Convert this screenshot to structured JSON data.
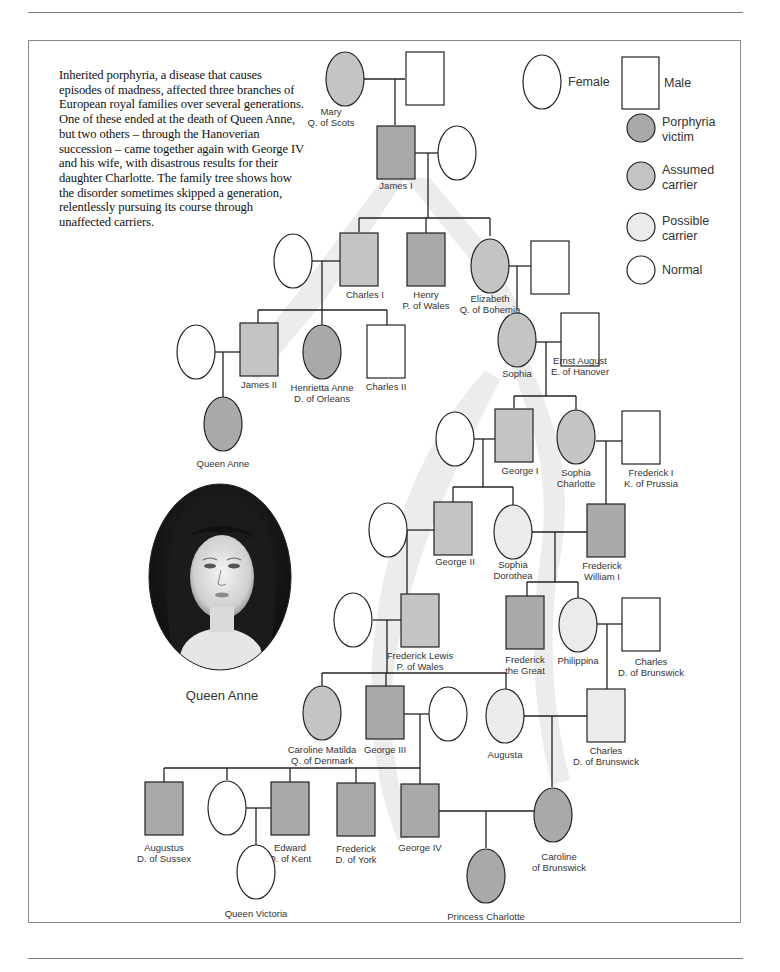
{
  "intro_text": "Inherited porphyria, a disease that causes episodes of madness, affected three branches of European royal families over several generations. One of these ended at the death of Queen Anne, but two others – through the Hanoverian succession – came together again with George IV and his wife, with disastrous results for their daughter Charlotte. The family tree shows how the disorder sometimes skipped a generation, relentlessly pursuing its course through unaffected carriers.",
  "colors": {
    "victim": "#a9a9a9",
    "assumed_carrier": "#c4c4c4",
    "possible_carrier": "#ebebeb",
    "normal": "#ffffff",
    "path_band": "#ececec",
    "line": "#222222"
  },
  "legend": {
    "female": "Female",
    "male": "Male",
    "items": [
      {
        "status": "victim",
        "label_1": "Porphyria",
        "label_2": "victim"
      },
      {
        "status": "assumed_carrier",
        "label_1": "Assumed",
        "label_2": "carrier"
      },
      {
        "status": "possible_carrier",
        "label_1": "Possible",
        "label_2": "carrier"
      },
      {
        "status": "normal",
        "label_1": "Normal",
        "label_2": ""
      }
    ]
  },
  "portrait": {
    "caption": "Queen Anne"
  },
  "people": [
    {
      "id": "mary",
      "line1": "Mary",
      "line2": "Q. of Scots",
      "sex": "F",
      "status": "assumed_carrier"
    },
    {
      "id": "mary_spouse",
      "line1": "",
      "line2": "",
      "sex": "M",
      "status": "normal"
    },
    {
      "id": "james1",
      "line1": "James I",
      "line2": "",
      "sex": "M",
      "status": "victim"
    },
    {
      "id": "james1_spouse",
      "line1": "",
      "line2": "",
      "sex": "F",
      "status": "normal"
    },
    {
      "id": "charles1_spouse",
      "line1": "",
      "line2": "",
      "sex": "F",
      "status": "normal"
    },
    {
      "id": "charles1",
      "line1": "Charles I",
      "line2": "",
      "sex": "M",
      "status": "assumed_carrier"
    },
    {
      "id": "henry",
      "line1": "Henry",
      "line2": "P. of Wales",
      "sex": "M",
      "status": "victim"
    },
    {
      "id": "elizabeth",
      "line1": "Elizabeth",
      "line2": "Q. of Bohemia",
      "sex": "F",
      "status": "assumed_carrier"
    },
    {
      "id": "elizabeth_spouse",
      "line1": "",
      "line2": "",
      "sex": "M",
      "status": "normal"
    },
    {
      "id": "james2_spouse",
      "line1": "",
      "line2": "",
      "sex": "F",
      "status": "normal"
    },
    {
      "id": "james2",
      "line1": "James II",
      "line2": "",
      "sex": "M",
      "status": "assumed_carrier"
    },
    {
      "id": "henrietta",
      "line1": "Henrietta Anne",
      "line2": "D. of Orleans",
      "sex": "F",
      "status": "victim"
    },
    {
      "id": "charles2",
      "line1": "Charles II",
      "line2": "",
      "sex": "M",
      "status": "normal"
    },
    {
      "id": "queen_anne",
      "line1": "Queen Anne",
      "line2": "",
      "sex": "F",
      "status": "victim"
    },
    {
      "id": "sophia",
      "line1": "Sophia",
      "line2": "",
      "sex": "F",
      "status": "assumed_carrier"
    },
    {
      "id": "ernst",
      "line1": "Ernst August",
      "line2": "E. of Hanover",
      "sex": "M",
      "status": "normal"
    },
    {
      "id": "george1_spouse",
      "line1": "",
      "line2": "",
      "sex": "F",
      "status": "normal"
    },
    {
      "id": "george1",
      "line1": "George I",
      "line2": "",
      "sex": "M",
      "status": "assumed_carrier"
    },
    {
      "id": "sophia_charlotte",
      "line1": "Sophia",
      "line2": "Charlotte",
      "sex": "F",
      "status": "assumed_carrier"
    },
    {
      "id": "frederick1",
      "line1": "Frederick I",
      "line2": "K. of Prussia",
      "sex": "M",
      "status": "normal"
    },
    {
      "id": "george2_spouse",
      "line1": "",
      "line2": "",
      "sex": "F",
      "status": "normal"
    },
    {
      "id": "george2",
      "line1": "George II",
      "line2": "",
      "sex": "M",
      "status": "assumed_carrier"
    },
    {
      "id": "sophia_dorothea",
      "line1": "Sophia",
      "line2": "Dorothea",
      "sex": "F",
      "status": "possible_carrier"
    },
    {
      "id": "fw1",
      "line1": "Frederick",
      "line2": "William I",
      "sex": "M",
      "status": "victim"
    },
    {
      "id": "fl_spouse",
      "line1": "",
      "line2": "",
      "sex": "F",
      "status": "normal"
    },
    {
      "id": "frederick_lewis",
      "line1": "Frederick Lewis",
      "line2": "P. of Wales",
      "sex": "M",
      "status": "assumed_carrier"
    },
    {
      "id": "frederick_great",
      "line1": "Frederick",
      "line2": "the Great",
      "sex": "M",
      "status": "victim"
    },
    {
      "id": "philippina",
      "line1": "Philippina",
      "line2": "",
      "sex": "F",
      "status": "possible_carrier"
    },
    {
      "id": "charles_db1",
      "line1": "Charles",
      "line2": "D. of Brunswick",
      "sex": "M",
      "status": "normal"
    },
    {
      "id": "caroline_matilda",
      "line1": "Caroline Matilda",
      "line2": "Q. of Denmark",
      "sex": "F",
      "status": "assumed_carrier"
    },
    {
      "id": "george3",
      "line1": "George III",
      "line2": "",
      "sex": "M",
      "status": "victim"
    },
    {
      "id": "george3_spouse",
      "line1": "",
      "line2": "",
      "sex": "F",
      "status": "normal"
    },
    {
      "id": "augusta",
      "line1": "Augusta",
      "line2": "",
      "sex": "F",
      "status": "possible_carrier"
    },
    {
      "id": "charles_db2",
      "line1": "Charles",
      "line2": "D. of Brunswick",
      "sex": "M",
      "status": "possible_carrier"
    },
    {
      "id": "augustus",
      "line1": "Augustus",
      "line2": "D. of Sussex",
      "sex": "M",
      "status": "victim"
    },
    {
      "id": "edward_spouse",
      "line1": "",
      "line2": "",
      "sex": "F",
      "status": "normal"
    },
    {
      "id": "edward",
      "line1": "Edward",
      "line2": "D. of Kent",
      "sex": "M",
      "status": "victim"
    },
    {
      "id": "frederick_york",
      "line1": "Frederick",
      "line2": "D. of York",
      "sex": "M",
      "status": "victim"
    },
    {
      "id": "george4",
      "line1": "George IV",
      "line2": "",
      "sex": "M",
      "status": "victim"
    },
    {
      "id": "caroline_brunswick",
      "line1": "Caroline",
      "line2": "of Brunswick",
      "sex": "F",
      "status": "victim"
    },
    {
      "id": "queen_victoria",
      "line1": "Queen Victoria",
      "line2": "",
      "sex": "F",
      "status": "normal"
    },
    {
      "id": "princess_charlotte",
      "line1": "Princess Charlotte",
      "line2": "",
      "sex": "F",
      "status": "victim"
    }
  ]
}
